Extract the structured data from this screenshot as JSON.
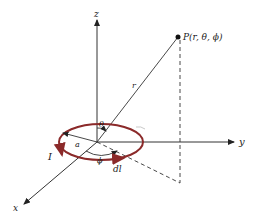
{
  "diagram": {
    "axes": {
      "z": "z",
      "y": "y",
      "x": "x"
    },
    "point_label": "P(r, θ, ϕ)",
    "radius_label": "r",
    "theta_label": "θ",
    "phi_label": "ϕ",
    "loop_radius_label": "a",
    "current_label": "I",
    "element_label": "dl",
    "colors": {
      "loop": "#8b2a2a",
      "line": "#222222"
    }
  }
}
